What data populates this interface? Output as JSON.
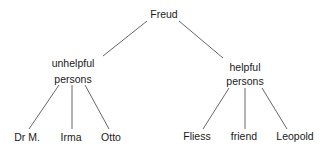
{
  "diagram": {
    "type": "tree",
    "root": {
      "label": "Freud"
    },
    "branches": [
      {
        "label_line1": "unhelpful",
        "label_line2": "persons",
        "children": [
          "Dr M.",
          "Irma",
          "Otto"
        ]
      },
      {
        "label_line1": "helpful",
        "label_line2": "persons",
        "children": [
          "Fliess",
          "friend",
          "Leopold"
        ]
      }
    ],
    "line_color": "#555555",
    "text_color": "#1a1a1a"
  }
}
